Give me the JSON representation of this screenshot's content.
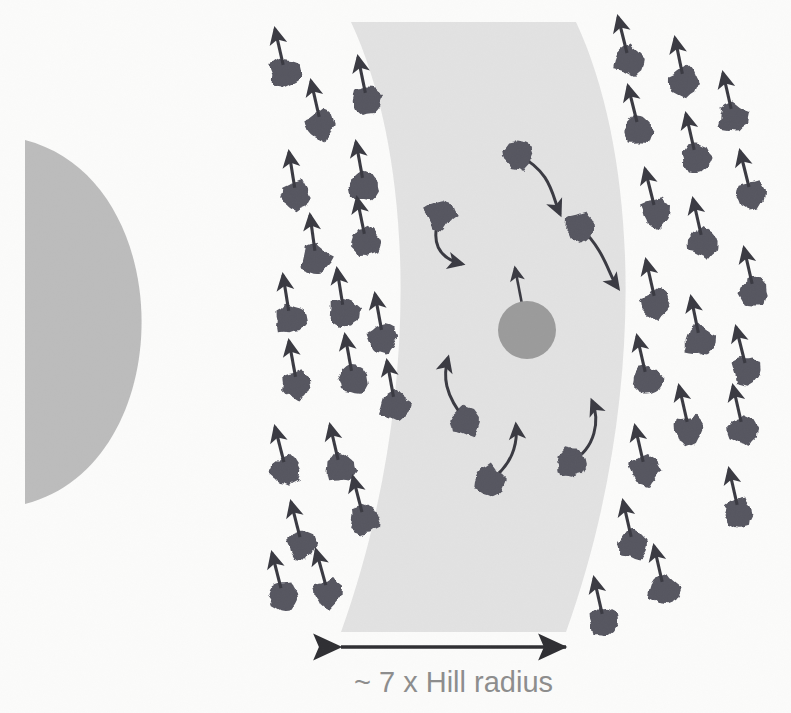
{
  "figure": {
    "background_color": "#fbfbfa"
  },
  "colors": {
    "background": "#fbfbfa",
    "star_grey": "#bcbcbc",
    "gap_band_grey": "#e2e2e2",
    "planet_grey": "#9b9b9b",
    "particle_dark": "#565661",
    "arrow_dark": "#3a3a42",
    "label_grey": "#8d8d8d"
  },
  "annotation": {
    "width_label": "~ 7 x Hill radius",
    "measure_arrow": {
      "x1": 341,
      "x2": 566,
      "y": 647
    }
  },
  "star": {
    "name": "central-star",
    "shape": "half-disc",
    "flat_edge_x": 25,
    "center_y": 322,
    "radius_y": 182,
    "radius_x": 116,
    "color": "#bcbcbc"
  },
  "gap_band": {
    "name": "cleared-gap-band",
    "color": "#e2e2e2",
    "top_left_x": 351,
    "top_right_x": 576,
    "bottom_left_x": 341,
    "bottom_right_x": 566,
    "top_y": 22,
    "bottom_y": 632,
    "bulge": 72
  },
  "planet": {
    "name": "embedded-planet",
    "cx": 527,
    "cy": 330,
    "r": 29,
    "color": "#9b9b9b",
    "arrow": {
      "dx": -12,
      "dy": -62
    }
  },
  "particles_straight": [
    {
      "cx": 285,
      "cy": 73,
      "r": 15,
      "adx": -10,
      "ady": -44
    },
    {
      "cx": 367,
      "cy": 101,
      "r": 15,
      "adx": -9,
      "ady": -44
    },
    {
      "cx": 321,
      "cy": 125,
      "r": 15,
      "adx": -10,
      "ady": -44
    },
    {
      "cx": 296,
      "cy": 196,
      "r": 15,
      "adx": -7,
      "ady": -44
    },
    {
      "cx": 364,
      "cy": 186,
      "r": 15,
      "adx": -8,
      "ady": -44
    },
    {
      "cx": 316,
      "cy": 259,
      "r": 15,
      "adx": -6,
      "ady": -44
    },
    {
      "cx": 366,
      "cy": 242,
      "r": 15,
      "adx": -9,
      "ady": -44
    },
    {
      "cx": 290,
      "cy": 319,
      "r": 15,
      "adx": -7,
      "ady": -44
    },
    {
      "cx": 344,
      "cy": 313,
      "r": 15,
      "adx": -7,
      "ady": -44
    },
    {
      "cx": 383,
      "cy": 338,
      "r": 15,
      "adx": -8,
      "ady": -44
    },
    {
      "cx": 297,
      "cy": 385,
      "r": 15,
      "adx": -8,
      "ady": -44
    },
    {
      "cx": 353,
      "cy": 379,
      "r": 15,
      "adx": -8,
      "ady": -44
    },
    {
      "cx": 395,
      "cy": 405,
      "r": 15,
      "adx": -8,
      "ady": -44
    },
    {
      "cx": 286,
      "cy": 470,
      "r": 15,
      "adx": -11,
      "ady": -43
    },
    {
      "cx": 340,
      "cy": 468,
      "r": 15,
      "adx": -10,
      "ady": -43
    },
    {
      "cx": 364,
      "cy": 520,
      "r": 15,
      "adx": -11,
      "ady": -43
    },
    {
      "cx": 302,
      "cy": 545,
      "r": 15,
      "adx": -11,
      "ady": -43
    },
    {
      "cx": 328,
      "cy": 593,
      "r": 15,
      "adx": -12,
      "ady": -43
    },
    {
      "cx": 283,
      "cy": 596,
      "r": 15,
      "adx": -11,
      "ady": -43
    },
    {
      "cx": 629,
      "cy": 61,
      "r": 15,
      "adx": -11,
      "ady": -44
    },
    {
      "cx": 684,
      "cy": 82,
      "r": 15,
      "adx": -9,
      "ady": -44
    },
    {
      "cx": 639,
      "cy": 130,
      "r": 15,
      "adx": -11,
      "ady": -44
    },
    {
      "cx": 733,
      "cy": 117,
      "r": 15,
      "adx": -10,
      "ady": -44
    },
    {
      "cx": 696,
      "cy": 158,
      "r": 15,
      "adx": -10,
      "ady": -44
    },
    {
      "cx": 656,
      "cy": 213,
      "r": 15,
      "adx": -11,
      "ady": -44
    },
    {
      "cx": 751,
      "cy": 195,
      "r": 15,
      "adx": -11,
      "ady": -44
    },
    {
      "cx": 703,
      "cy": 243,
      "r": 15,
      "adx": -10,
      "ady": -44
    },
    {
      "cx": 656,
      "cy": 304,
      "r": 15,
      "adx": -10,
      "ady": -44
    },
    {
      "cx": 754,
      "cy": 292,
      "r": 15,
      "adx": -10,
      "ady": -44
    },
    {
      "cx": 700,
      "cy": 341,
      "r": 15,
      "adx": -9,
      "ady": -44
    },
    {
      "cx": 647,
      "cy": 380,
      "r": 15,
      "adx": -10,
      "ady": -44
    },
    {
      "cx": 747,
      "cy": 371,
      "r": 15,
      "adx": -11,
      "ady": -44
    },
    {
      "cx": 689,
      "cy": 430,
      "r": 15,
      "adx": -10,
      "ady": -44
    },
    {
      "cx": 743,
      "cy": 430,
      "r": 15,
      "adx": -10,
      "ady": -44
    },
    {
      "cx": 645,
      "cy": 470,
      "r": 15,
      "adx": -10,
      "ady": -44
    },
    {
      "cx": 739,
      "cy": 513,
      "r": 15,
      "adx": -10,
      "ady": -44
    },
    {
      "cx": 633,
      "cy": 545,
      "r": 15,
      "adx": -10,
      "ady": -44
    },
    {
      "cx": 664,
      "cy": 590,
      "r": 15,
      "adx": -10,
      "ady": -44
    },
    {
      "cx": 604,
      "cy": 622,
      "r": 15,
      "adx": -10,
      "ady": -44
    }
  ],
  "particles_curved": [
    {
      "cx": 518,
      "cy": 155,
      "r": 15,
      "cp1x": 552,
      "cp1y": 172,
      "cp2x": 552,
      "cp2y": 196,
      "ex": 560,
      "ey": 214
    },
    {
      "cx": 440,
      "cy": 215,
      "r": 15,
      "cp1x": 430,
      "cp1y": 242,
      "cp2x": 438,
      "cp2y": 258,
      "ex": 462,
      "ey": 264
    },
    {
      "cx": 580,
      "cy": 227,
      "r": 15,
      "cp1x": 606,
      "cp1y": 252,
      "cp2x": 608,
      "cp2y": 274,
      "ex": 618,
      "ey": 288
    },
    {
      "cx": 466,
      "cy": 421,
      "r": 15,
      "cp1x": 444,
      "cp1y": 394,
      "cp2x": 443,
      "cp2y": 376,
      "ex": 448,
      "ey": 358
    },
    {
      "cx": 489,
      "cy": 481,
      "r": 15,
      "cp1x": 512,
      "cp1y": 466,
      "cp2x": 518,
      "cp2y": 444,
      "ex": 516,
      "ey": 425
    },
    {
      "cx": 571,
      "cy": 462,
      "r": 15,
      "cp1x": 596,
      "cp1y": 448,
      "cp2x": 600,
      "cp2y": 420,
      "ex": 592,
      "ey": 401
    }
  ]
}
